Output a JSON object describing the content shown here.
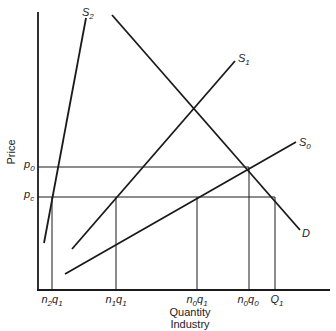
{
  "diagram": {
    "y_axis_label": "Price",
    "x_axis_label_line1": "Quantity",
    "x_axis_label_line2": "Industry",
    "price_levels": [
      {
        "id": "p0",
        "base": "p",
        "sub": "0"
      },
      {
        "id": "pc",
        "base": "p",
        "sub": "c"
      }
    ],
    "quantity_ticks": [
      {
        "id": "n2q1",
        "parts": [
          [
            "n",
            "2"
          ],
          [
            "q",
            "1"
          ]
        ]
      },
      {
        "id": "n1q1",
        "parts": [
          [
            "n",
            "1"
          ],
          [
            "q",
            "1"
          ]
        ]
      },
      {
        "id": "n0q1",
        "parts": [
          [
            "n",
            "0"
          ],
          [
            "q",
            "1"
          ]
        ]
      },
      {
        "id": "n0q0",
        "parts": [
          [
            "n",
            "0"
          ],
          [
            "q",
            "0"
          ]
        ]
      },
      {
        "id": "Q1",
        "parts": [
          [
            "Q",
            "1"
          ]
        ]
      }
    ],
    "curves": [
      {
        "id": "S2",
        "base": "S",
        "sub": "2",
        "type": "supply"
      },
      {
        "id": "S1",
        "base": "S",
        "sub": "1",
        "type": "supply"
      },
      {
        "id": "S0",
        "base": "S",
        "sub": "0",
        "type": "supply"
      },
      {
        "id": "D",
        "base": "D",
        "sub": "",
        "type": "demand"
      }
    ]
  }
}
